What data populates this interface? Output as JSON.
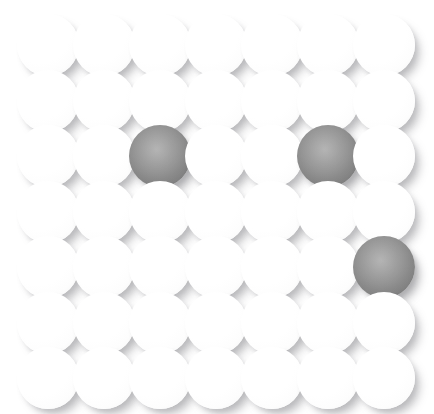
{
  "canvas": {
    "width": 434,
    "height": 414,
    "background_color": "#ffffff",
    "title": "Sphere Grid"
  },
  "grid": {
    "rows": 7,
    "columns": 7,
    "total_spheres": 49,
    "sphere_diameter": 62,
    "sphere_radius": 31,
    "column_spacing": 56,
    "row_spacing": 55.5,
    "first_center_x": 48,
    "first_center_y": 45
  },
  "legend": {
    "light_label": "light sphere",
    "dark_label": "dark sphere",
    "light_count": 46,
    "dark_count": 3
  },
  "colors": {
    "background": "#ffffff",
    "light_sphere_core": "#ffffff",
    "light_sphere_edge": "#efeff0",
    "dark_sphere_core": "#a6a6a6",
    "dark_sphere_mid": "#919191",
    "dark_sphere_edge": "#7a7a7a",
    "shadow": "rgba(120,120,125,0.38)"
  },
  "dark_positions": [
    {
      "row": 3,
      "column": 3
    },
    {
      "row": 3,
      "column": 6
    },
    {
      "row": 5,
      "column": 7
    }
  ],
  "chart_data": {
    "type": "heatmap",
    "xlabel": "",
    "ylabel": "",
    "rows": 7,
    "columns": 7,
    "categories": [
      "c1",
      "c2",
      "c3",
      "c4",
      "c5",
      "c6",
      "c7"
    ],
    "row_labels": [
      "r1",
      "r2",
      "r3",
      "r4",
      "r5",
      "r6",
      "r7"
    ],
    "legend": [
      "light = 0",
      "dark = 1"
    ],
    "values": [
      [
        0,
        0,
        0,
        0,
        0,
        0,
        0
      ],
      [
        0,
        0,
        0,
        0,
        0,
        0,
        0
      ],
      [
        0,
        0,
        1,
        0,
        0,
        1,
        0
      ],
      [
        0,
        0,
        0,
        0,
        0,
        0,
        0
      ],
      [
        0,
        0,
        0,
        0,
        0,
        0,
        1
      ],
      [
        0,
        0,
        0,
        0,
        0,
        0,
        0
      ],
      [
        0,
        0,
        0,
        0,
        0,
        0,
        0
      ]
    ]
  }
}
